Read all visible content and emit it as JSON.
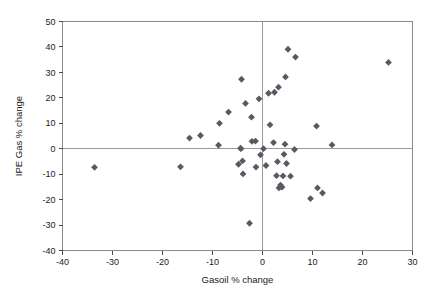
{
  "chart_data": {
    "type": "scatter",
    "title": "",
    "xlabel": "Gasoil % change",
    "ylabel": "IPE Gas % change",
    "xlim": [
      -40,
      30
    ],
    "ylim": [
      -40,
      50
    ],
    "xticks": [
      -40,
      -30,
      -20,
      -10,
      0,
      10,
      20,
      30
    ],
    "xtick_labels": [
      "-40",
      "-30",
      "-20",
      "-10",
      "0",
      "10",
      "20",
      "30"
    ],
    "yticks": [
      -40,
      -30,
      -20,
      -10,
      0,
      10,
      20,
      30,
      40,
      50
    ],
    "ytick_labels": [
      "-40",
      "-30",
      "-20",
      "-10",
      "0",
      "10",
      "20",
      "30",
      "40",
      "50"
    ],
    "grid": false,
    "legend": null,
    "zero_lines": {
      "x": 0,
      "y": 0
    },
    "marker_color": "#595964",
    "marker_shape": "diamond",
    "marker_size": 3.4,
    "points": [
      {
        "x": -33.6,
        "y": -7.3
      },
      {
        "x": -16.4,
        "y": -7.1
      },
      {
        "x": -14.6,
        "y": 4.2
      },
      {
        "x": -12.4,
        "y": 5.2
      },
      {
        "x": -8.8,
        "y": 1.4
      },
      {
        "x": -8.6,
        "y": 10.0
      },
      {
        "x": -6.8,
        "y": 14.4
      },
      {
        "x": -4.8,
        "y": -6.1
      },
      {
        "x": -4.4,
        "y": 0.2
      },
      {
        "x": -4.3,
        "y": 0.0
      },
      {
        "x": -4.2,
        "y": 27.3
      },
      {
        "x": -4.0,
        "y": -4.8
      },
      {
        "x": -3.9,
        "y": -9.9
      },
      {
        "x": -3.4,
        "y": 17.8
      },
      {
        "x": -2.6,
        "y": -29.3
      },
      {
        "x": -2.2,
        "y": 12.4
      },
      {
        "x": -2.1,
        "y": 2.9
      },
      {
        "x": -1.4,
        "y": 3.0
      },
      {
        "x": -1.3,
        "y": -7.2
      },
      {
        "x": -0.7,
        "y": 19.6
      },
      {
        "x": -0.4,
        "y": -2.4
      },
      {
        "x": 0.2,
        "y": 0.0
      },
      {
        "x": 0.7,
        "y": -6.6
      },
      {
        "x": 1.2,
        "y": 21.8
      },
      {
        "x": 1.5,
        "y": 9.4
      },
      {
        "x": 2.2,
        "y": 2.4
      },
      {
        "x": 2.4,
        "y": 22.2
      },
      {
        "x": 2.8,
        "y": -10.6
      },
      {
        "x": 3.0,
        "y": -5.1
      },
      {
        "x": 3.2,
        "y": 24.2
      },
      {
        "x": 3.3,
        "y": -15.4
      },
      {
        "x": 3.6,
        "y": -14.3
      },
      {
        "x": 3.9,
        "y": -15.1
      },
      {
        "x": 4.1,
        "y": -10.7
      },
      {
        "x": 4.3,
        "y": -2.2
      },
      {
        "x": 4.5,
        "y": 1.8
      },
      {
        "x": 4.6,
        "y": 28.2
      },
      {
        "x": 4.8,
        "y": -5.8
      },
      {
        "x": 5.1,
        "y": 39.1
      },
      {
        "x": 5.6,
        "y": -10.8
      },
      {
        "x": 6.4,
        "y": -0.3
      },
      {
        "x": 6.6,
        "y": 36.0
      },
      {
        "x": 9.6,
        "y": -19.6
      },
      {
        "x": 10.8,
        "y": 8.9
      },
      {
        "x": 11.0,
        "y": -15.4
      },
      {
        "x": 12.0,
        "y": -17.4
      },
      {
        "x": 13.9,
        "y": 1.5
      },
      {
        "x": 25.2,
        "y": 33.9
      }
    ]
  }
}
